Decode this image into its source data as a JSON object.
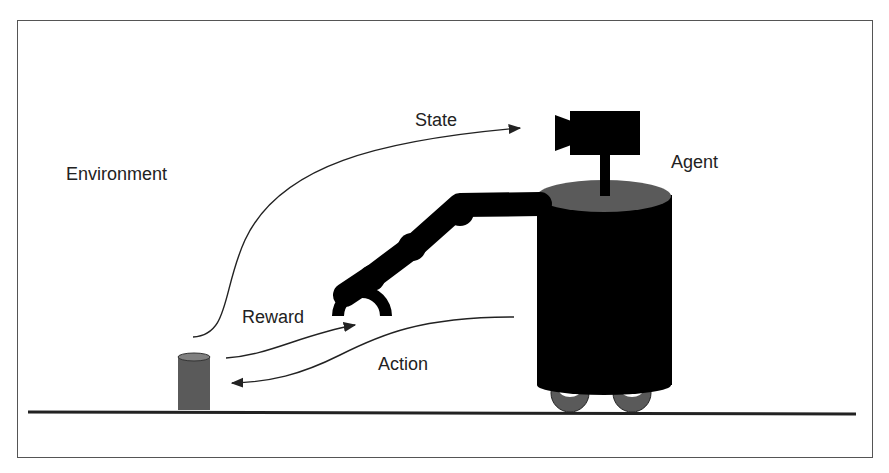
{
  "diagram": {
    "labels": {
      "environment": "Environment",
      "agent": "Agent",
      "state": "State",
      "reward": "Reward",
      "action": "Action"
    },
    "colors": {
      "agent_body": "#000000",
      "agent_top": "#5a5a5a",
      "object": "#5a5a5a",
      "wheel": "#5a5a5a",
      "ground": "#222222",
      "arrow": "#222222",
      "frame": "#555555"
    }
  }
}
